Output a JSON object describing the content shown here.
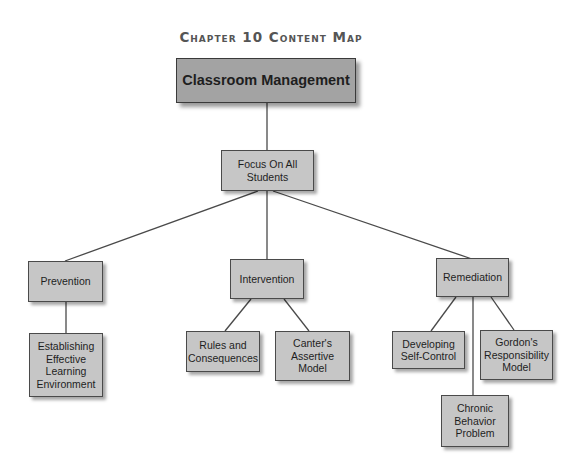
{
  "title": "Chapter 10 Content Map",
  "colors": {
    "main_box": "#a3a3a3",
    "box": "#c6c6c6",
    "border": "#4a4a4a",
    "line": "#4a4a4a"
  },
  "nodes": {
    "root": "Classroom Management",
    "focus": "Focus On All\nStudents",
    "prevention": "Prevention",
    "intervention": "Intervention",
    "remediation": "Remediation",
    "establishing": "Establishing\nEffective\nLearning\nEnvironment",
    "rules": "Rules and\nConsequences",
    "canter": "Canter's\nAssertive\nModel",
    "developing": "Developing\nSelf-Control",
    "gordon": "Gordon's\nResponsibility\nModel",
    "chronic": "Chronic\nBehavior\nProblem"
  },
  "edges": [
    [
      "root",
      "focus"
    ],
    [
      "focus",
      "prevention"
    ],
    [
      "focus",
      "intervention"
    ],
    [
      "focus",
      "remediation"
    ],
    [
      "prevention",
      "establishing"
    ],
    [
      "intervention",
      "rules"
    ],
    [
      "intervention",
      "canter"
    ],
    [
      "remediation",
      "developing"
    ],
    [
      "remediation",
      "chronic"
    ],
    [
      "remediation",
      "gordon"
    ]
  ]
}
